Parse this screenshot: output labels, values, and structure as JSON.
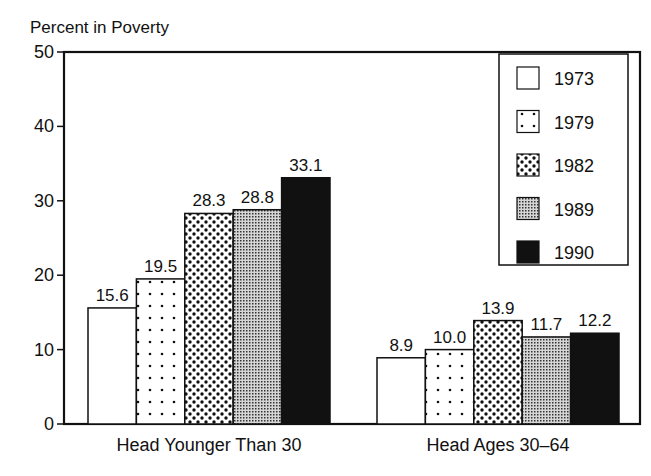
{
  "chart_data": {
    "type": "bar",
    "title": "",
    "ylabel": "Percent in Poverty",
    "xlabel": "",
    "ylim": [
      0,
      50
    ],
    "yticks": [
      0,
      10,
      20,
      30,
      40,
      50
    ],
    "grid": false,
    "legend_position": "upper right (inside)",
    "categories": [
      "Head Younger Than 30",
      "Head Ages 30–64"
    ],
    "series": [
      {
        "name": "1973",
        "values": [
          15.6,
          8.9
        ],
        "pattern": "white"
      },
      {
        "name": "1979",
        "values": [
          19.5,
          10.0
        ],
        "pattern": "sparse-dots"
      },
      {
        "name": "1982",
        "values": [
          28.3,
          13.9
        ],
        "pattern": "dense-dots"
      },
      {
        "name": "1989",
        "values": [
          28.8,
          11.7
        ],
        "pattern": "fine-gray-dots"
      },
      {
        "name": "1990",
        "values": [
          33.1,
          12.2
        ],
        "pattern": "solid-black"
      }
    ],
    "value_labels": [
      [
        "15.6",
        "19.5",
        "28.3",
        "28.8",
        "33.1"
      ],
      [
        "8.9",
        "10.0",
        "13.9",
        "11.7",
        "12.2"
      ]
    ]
  },
  "colors": {
    "ink": "#111111",
    "background": "#ffffff"
  }
}
